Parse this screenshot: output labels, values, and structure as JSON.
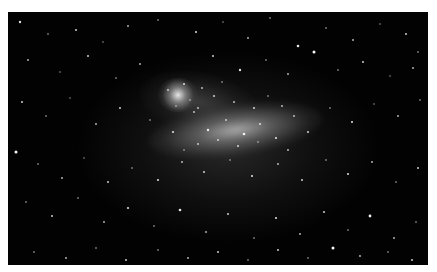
{
  "image": {
    "subject": "Large Magellanic Cloud galaxy star field",
    "frame": {
      "x": 8,
      "y": 12,
      "width": 420,
      "height": 253
    },
    "colors": {
      "background": "#020202",
      "page": "#ffffff",
      "star": "#ffffff"
    },
    "features": [
      {
        "name": "central-bar",
        "cx": 228,
        "cy": 118
      },
      {
        "name": "tarantula-nebula",
        "cx": 170,
        "cy": 83
      }
    ],
    "stars": [
      [
        12,
        10,
        1.2
      ],
      [
        40,
        22,
        0.8
      ],
      [
        68,
        18,
        1.0
      ],
      [
        95,
        30,
        0.7
      ],
      [
        120,
        14,
        0.9
      ],
      [
        150,
        8,
        0.8
      ],
      [
        188,
        20,
        1.1
      ],
      [
        215,
        10,
        0.7
      ],
      [
        240,
        26,
        0.9
      ],
      [
        262,
        6,
        0.8
      ],
      [
        290,
        34,
        1.3
      ],
      [
        318,
        16,
        0.8
      ],
      [
        345,
        28,
        0.9
      ],
      [
        372,
        12,
        0.7
      ],
      [
        398,
        22,
        1.0
      ],
      [
        410,
        40,
        0.8
      ],
      [
        20,
        48,
        0.9
      ],
      [
        52,
        60,
        0.7
      ],
      [
        80,
        44,
        1.0
      ],
      [
        108,
        66,
        0.8
      ],
      [
        132,
        52,
        0.9
      ],
      [
        205,
        44,
        1.0
      ],
      [
        232,
        58,
        1.2
      ],
      [
        258,
        48,
        0.8
      ],
      [
        280,
        62,
        0.9
      ],
      [
        306,
        40,
        1.5
      ],
      [
        330,
        58,
        0.8
      ],
      [
        355,
        50,
        1.0
      ],
      [
        382,
        64,
        0.7
      ],
      [
        405,
        56,
        0.9
      ],
      [
        14,
        90,
        1.0
      ],
      [
        38,
        104,
        0.8
      ],
      [
        62,
        86,
        0.7
      ],
      [
        88,
        112,
        0.9
      ],
      [
        112,
        96,
        1.0
      ],
      [
        142,
        108,
        0.8
      ],
      [
        165,
        120,
        1.1
      ],
      [
        186,
        100,
        0.9
      ],
      [
        200,
        118,
        1.2
      ],
      [
        218,
        108,
        0.9
      ],
      [
        236,
        122,
        1.3
      ],
      [
        252,
        112,
        1.0
      ],
      [
        268,
        126,
        1.1
      ],
      [
        286,
        104,
        0.9
      ],
      [
        300,
        120,
        1.0
      ],
      [
        322,
        96,
        0.8
      ],
      [
        344,
        110,
        1.1
      ],
      [
        366,
        92,
        0.7
      ],
      [
        390,
        104,
        0.9
      ],
      [
        412,
        88,
        0.8
      ],
      [
        8,
        140,
        1.5
      ],
      [
        30,
        152,
        0.8
      ],
      [
        54,
        166,
        0.9
      ],
      [
        76,
        146,
        0.7
      ],
      [
        100,
        170,
        1.0
      ],
      [
        124,
        156,
        0.8
      ],
      [
        150,
        168,
        1.1
      ],
      [
        174,
        150,
        0.9
      ],
      [
        196,
        160,
        1.0
      ],
      [
        222,
        148,
        0.8
      ],
      [
        244,
        164,
        1.1
      ],
      [
        270,
        152,
        0.9
      ],
      [
        294,
        168,
        1.0
      ],
      [
        318,
        148,
        0.8
      ],
      [
        340,
        162,
        1.1
      ],
      [
        364,
        150,
        0.9
      ],
      [
        388,
        170,
        0.8
      ],
      [
        410,
        156,
        1.0
      ],
      [
        18,
        190,
        0.8
      ],
      [
        44,
        204,
        1.0
      ],
      [
        70,
        186,
        0.8
      ],
      [
        96,
        210,
        0.9
      ],
      [
        120,
        196,
        1.1
      ],
      [
        146,
        214,
        0.8
      ],
      [
        172,
        198,
        1.3
      ],
      [
        198,
        220,
        0.9
      ],
      [
        220,
        202,
        1.0
      ],
      [
        246,
        226,
        0.8
      ],
      [
        268,
        206,
        1.1
      ],
      [
        292,
        222,
        0.9
      ],
      [
        316,
        200,
        1.0
      ],
      [
        340,
        218,
        0.8
      ],
      [
        362,
        204,
        1.4
      ],
      [
        386,
        226,
        0.9
      ],
      [
        408,
        210,
        0.8
      ],
      [
        26,
        240,
        0.8
      ],
      [
        58,
        246,
        0.9
      ],
      [
        88,
        236,
        0.8
      ],
      [
        118,
        248,
        1.0
      ],
      [
        150,
        238,
        0.8
      ],
      [
        180,
        246,
        0.9
      ],
      [
        210,
        240,
        1.0
      ],
      [
        240,
        248,
        0.8
      ],
      [
        270,
        238,
        1.0
      ],
      [
        300,
        246,
        0.8
      ],
      [
        325,
        236,
        1.5
      ],
      [
        352,
        244,
        0.9
      ],
      [
        380,
        240,
        0.8
      ],
      [
        404,
        248,
        1.0
      ],
      [
        160,
        78,
        0.9
      ],
      [
        176,
        72,
        1.0
      ],
      [
        182,
        88,
        0.8
      ],
      [
        194,
        76,
        0.9
      ],
      [
        206,
        84,
        1.0
      ],
      [
        214,
        70,
        0.8
      ],
      [
        226,
        90,
        0.9
      ],
      [
        168,
        94,
        0.8
      ],
      [
        190,
        96,
        0.9
      ],
      [
        246,
        96,
        1.0
      ],
      [
        260,
        84,
        0.8
      ],
      [
        274,
        94,
        0.9
      ],
      [
        210,
        128,
        0.9
      ],
      [
        230,
        134,
        1.0
      ],
      [
        250,
        130,
        0.8
      ],
      [
        190,
        132,
        0.9
      ],
      [
        176,
        138,
        0.8
      ],
      [
        280,
        138,
        0.9
      ]
    ]
  }
}
